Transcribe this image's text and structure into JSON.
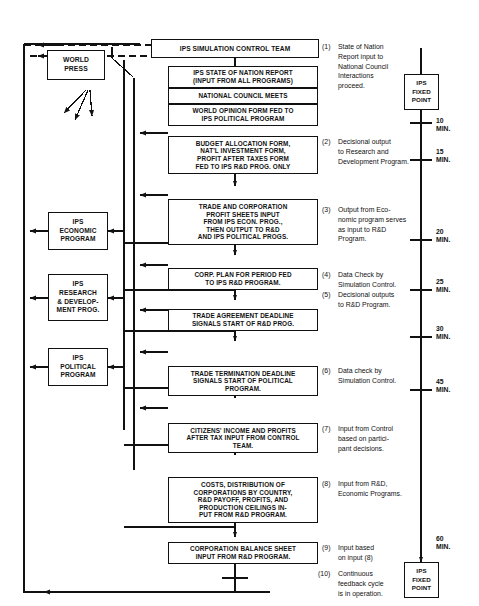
{
  "diagram": {
    "header_box": {
      "label": "IPS SIMULATION CONTROL TEAM"
    },
    "press_box": {
      "line1": "WORLD",
      "line2": "PRESS"
    },
    "fixed_point_top": {
      "line1": "IPS",
      "line2": "FIXED",
      "line3": "POINT"
    },
    "fixed_point_bottom": {
      "line1": "IPS",
      "line2": "FIXED",
      "line3": "POINT"
    },
    "programs": [
      {
        "id": "economic",
        "lines": [
          "IPS",
          "ECONOMIC",
          "PROGRAM"
        ]
      },
      {
        "id": "research",
        "lines": [
          "IPS",
          "RESEARCH",
          "& DEVELOP-",
          "MENT PROG."
        ]
      },
      {
        "id": "political",
        "lines": [
          "IPS",
          "POLITICAL",
          "PROGRAM"
        ]
      }
    ],
    "steps": [
      {
        "id": "state-of-nation",
        "lines": [
          "IPS STATE OF NATION REPORT",
          "(INPUT FROM ALL PROGRAMS)"
        ]
      },
      {
        "id": "national-council",
        "lines": [
          "NATIONAL COUNCIL MEETS"
        ]
      },
      {
        "id": "world-opinion",
        "lines": [
          "WORLD OPINION FORM FED TO",
          "IPS POLITICAL PROGRAM"
        ]
      },
      {
        "id": "budget-allocation",
        "lines": [
          "BUDGET ALLOCATION FORM,",
          "NAT'L INVESTMENT FORM,",
          "PROFIT AFTER TAXES FORM",
          "FED TO IPS R&D PROG. ONLY"
        ]
      },
      {
        "id": "trade-corp-profit",
        "lines": [
          "TRADE AND CORPORATION",
          "PROFIT SHEETS INPUT",
          "FROM IPS ECON. PROG.,",
          "THEN OUTPUT TO R&D",
          "AND IPS POLITICAL PROGS."
        ]
      },
      {
        "id": "corp-plan",
        "lines": [
          "CORP. PLAN FOR PERIOD FED",
          "TO IPS R&D PROGRAM."
        ]
      },
      {
        "id": "trade-agreement",
        "lines": [
          "TRADE AGREEMENT DEADLINE",
          "SIGNALS START OF R&D PROG."
        ]
      },
      {
        "id": "trade-termination",
        "lines": [
          "TRADE TERMINATION DEADLINE",
          "SIGNALS START OF POLITICAL",
          "PROGRAM."
        ]
      },
      {
        "id": "citizens-income",
        "lines": [
          "CITIZENS' INCOME AND PROFITS",
          "AFTER TAX INPUT FROM CONTROL",
          "TEAM."
        ]
      },
      {
        "id": "costs-distribution",
        "lines": [
          "COSTS, DISTRIBUTION OF",
          "CORPORATIONS BY COUNTRY,",
          "R&D PAYOFF, PROFITS, AND",
          "PRODUCTION CEILINGS IN-",
          "PUT FROM R&D PROGRAM."
        ]
      },
      {
        "id": "corp-balance-sheet",
        "lines": [
          "CORPORATION BALANCE SHEET",
          "INPUT FROM R&D PROGRAM."
        ]
      }
    ],
    "notes": [
      {
        "num": "(1)",
        "lines": [
          "State of Nation",
          "Report input to",
          "National Council",
          "Interactions",
          "proceed."
        ]
      },
      {
        "num": "(2)",
        "lines": [
          "Decisional output",
          "to Research and",
          "Development Program."
        ]
      },
      {
        "num": "(3)",
        "lines": [
          "Output from Eco-",
          "nomic program serves",
          "as input to R&D",
          "Program."
        ]
      },
      {
        "num": "(4)",
        "lines": [
          "Data Check by",
          "Simulation Control."
        ]
      },
      {
        "num": "(5)",
        "lines": [
          "Decisional outputs",
          "to R&D Program."
        ]
      },
      {
        "num": "(6)",
        "lines": [
          "Data check by",
          "Simulation Control."
        ]
      },
      {
        "num": "(7)",
        "lines": [
          "Input from Control",
          "based on partici-",
          "pant decisions."
        ]
      },
      {
        "num": "(8)",
        "lines": [
          "Input from R&D,",
          "Economic Programs."
        ]
      },
      {
        "num": "(9)",
        "lines": [
          "Input based",
          "on input (8)"
        ]
      },
      {
        "num": "(10)",
        "lines": [
          "Continuous",
          "feedback cycle",
          "is in operation."
        ]
      }
    ],
    "time_ticks": [
      {
        "value": "10",
        "unit": "MIN."
      },
      {
        "value": "15",
        "unit": "MIN."
      },
      {
        "value": "20",
        "unit": "MIN."
      },
      {
        "value": "25",
        "unit": "MIN."
      },
      {
        "value": "30",
        "unit": "MIN."
      },
      {
        "value": "45",
        "unit": "MIN."
      },
      {
        "value": "60",
        "unit": "MIN."
      }
    ],
    "colors": {
      "ink": "#111111",
      "paper": "#ffffff"
    }
  }
}
